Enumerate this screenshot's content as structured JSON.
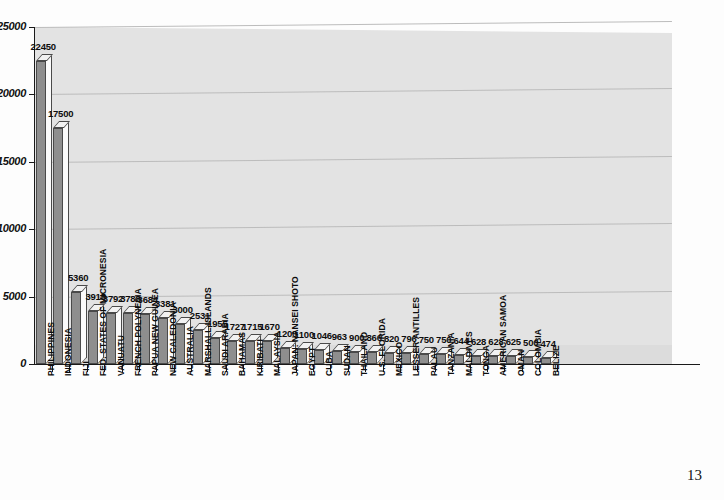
{
  "page": {
    "page_number": "13"
  },
  "chart_data": {
    "type": "bar",
    "title": "",
    "xlabel": "",
    "ylabel": "",
    "ylim": [
      0,
      25000
    ],
    "grid": true,
    "legend": "none",
    "y_ticks": [
      "0",
      "5000",
      "10000",
      "15000",
      "20000",
      "25000"
    ],
    "y_tick_values": [
      0,
      5000,
      10000,
      15000,
      20000,
      25000
    ],
    "categories": [
      "PHILIPPINES",
      "INDONESIA",
      "FIJI",
      "FED. STATES OF MICRONESIA",
      "VANUATU",
      "FRENCH POLYNESIA",
      "PAPUA NEW GUINEA",
      "NEW CALEDONIA",
      "AUSTRALIA",
      "MARSHALL ISLANDS",
      "SAUDI ARABIA",
      "BAHAMAS",
      "KIRIBATI",
      "MALAYSIA",
      "JAPAN: NANSEI SHOTO",
      "EGYPT",
      "CUBA",
      "SUDAN",
      "THAILAND",
      "U.S. FLORIDA",
      "MEXICO",
      "LESSER ANTILLES",
      "PALAU",
      "TANZANIA",
      "MALDIVES",
      "TONGA",
      "AMERICAN SAMOA",
      "OMAN",
      "COLOMBIA",
      "BELIZE"
    ],
    "values": [
      22450,
      17500,
      5360,
      3915,
      3792,
      3788,
      3684,
      3381,
      3000,
      2531,
      1955,
      1727,
      1715,
      1670,
      1200,
      1100,
      1046,
      963,
      900,
      866,
      820,
      796,
      750,
      750,
      644,
      628,
      628,
      625,
      500,
      474
    ],
    "value_labels": [
      "22450",
      "17500",
      "5360",
      "3915",
      "3792",
      "3788",
      "3684",
      "3381",
      "3000",
      "2531",
      "1955",
      "1727",
      "1715",
      "1670",
      "1200",
      "1100",
      "1046",
      "963",
      "900",
      "866",
      "820",
      "796",
      "750",
      "750",
      "644",
      "628",
      "628",
      "625",
      "500",
      "474"
    ],
    "colors": {
      "bar_front": "#8e8e8e",
      "bar_side": "#fbfbfb",
      "bar_top": "#f2f2f2",
      "bar_outline": "#4a4a4a",
      "plot_background": "#e3e3e3",
      "gridline": "#bcbcbc",
      "axis": "#1a1a1a",
      "text": "#0d0d0d"
    }
  }
}
